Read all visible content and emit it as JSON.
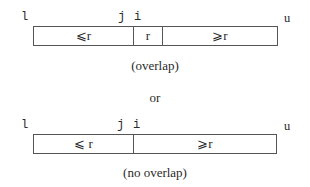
{
  "diagram": {
    "overlap": {
      "labels": {
        "left": "l",
        "j": "j",
        "i": "i",
        "right": "u"
      },
      "cells": [
        {
          "label": "⩽r"
        },
        {
          "label": "r"
        },
        {
          "label": "⩾r"
        }
      ],
      "caption": "(overlap)"
    },
    "separator": "or",
    "no_overlap": {
      "labels": {
        "left": "l",
        "j": "j",
        "i": "i",
        "right": "u"
      },
      "cells": [
        {
          "label": "⩽ r"
        },
        {
          "label": "⩾r"
        }
      ],
      "caption": "(no overlap)"
    }
  }
}
